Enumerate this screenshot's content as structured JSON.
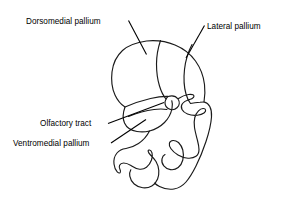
{
  "figure": {
    "kind": "anatomical-line-diagram",
    "background_color": "#ffffff",
    "line_color": "#1a1a1a",
    "text_color": "#000000"
  },
  "labels": {
    "dorsomedial_pallium": "Dorsomedial pallium",
    "lateral_pallium": "Lateral pallium",
    "olfactory_tract": "Olfactory tract",
    "ventromedial_pallium": "Ventromedial pallium"
  },
  "leaders": [
    {
      "name": "dorsomedial-pallium-leader",
      "from": "Dorsomedial pallium",
      "direction": "down-right"
    },
    {
      "name": "lateral-pallium-leader",
      "from": "Lateral pallium",
      "direction": "down-left"
    },
    {
      "name": "olfactory-tract-leader",
      "from": "Olfactory tract",
      "direction": "up-right"
    },
    {
      "name": "ventromedial-pallium-leader",
      "from": "Ventromedial pallium",
      "direction": "up-right"
    }
  ],
  "structures": [
    "outer-brain-outline",
    "dorsomedial-lateral-divider",
    "lateral-pallium-inner-contour",
    "olfactory-tract-circle",
    "olfactory-tract-stalk",
    "ventricle-contour",
    "ventral-lobe-contour",
    "ventral-hook-contour"
  ]
}
